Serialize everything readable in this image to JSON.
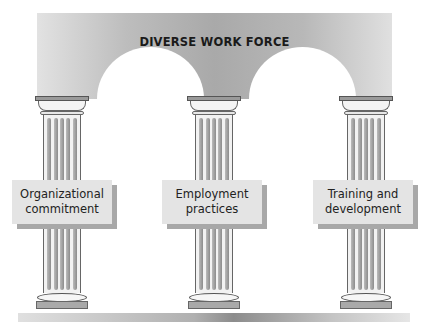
{
  "diagram": {
    "title": "DIVERSE WORK FORCE",
    "structure": "Roof/arch supported by three pillars standing on a floor",
    "pillars": [
      {
        "label": "Organizational\ncommitment"
      },
      {
        "label": "Employment\npractices"
      },
      {
        "label": "Training and\ndevelopment"
      }
    ],
    "colors": {
      "arch": "#b5b5b5",
      "label_box": "#e4e4e4",
      "label_shadow": "#a8a8a8",
      "text": "#1a1a1a"
    }
  }
}
